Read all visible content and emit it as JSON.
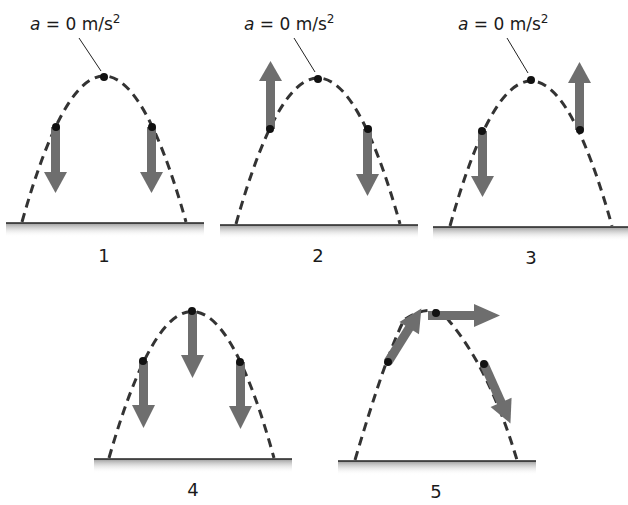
{
  "figure": {
    "accent_colors": {
      "arrow": "#6e6e6e",
      "path": "#333333",
      "ground_shadow": "#bdbdbd"
    },
    "panels": [
      {
        "id": 1,
        "label": "1",
        "annotation": "a = 0 m/s²",
        "annotation_parts": {
          "var": "a",
          "eq": " = 0 m/s",
          "sup": "2"
        },
        "arrows": [
          "down",
          "none",
          "down"
        ]
      },
      {
        "id": 2,
        "label": "2",
        "annotation": "a = 0 m/s²",
        "annotation_parts": {
          "var": "a",
          "eq": " = 0 m/s",
          "sup": "2"
        },
        "arrows": [
          "up",
          "none",
          "down"
        ]
      },
      {
        "id": 3,
        "label": "3",
        "annotation": "a = 0 m/s²",
        "annotation_parts": {
          "var": "a",
          "eq": " = 0 m/s",
          "sup": "2"
        },
        "arrows": [
          "down",
          "none",
          "up"
        ]
      },
      {
        "id": 4,
        "label": "4",
        "annotation": "",
        "arrows": [
          "down",
          "down",
          "down"
        ]
      },
      {
        "id": 5,
        "label": "5",
        "annotation": "",
        "arrows": [
          "up-right (tangent)",
          "right (tangent)",
          "down-right (tangent)"
        ]
      }
    ]
  }
}
